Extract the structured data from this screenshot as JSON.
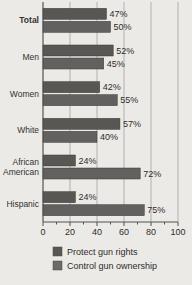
{
  "chart_data": {
    "type": "bar",
    "orientation": "horizontal",
    "title": "",
    "subtitle": "",
    "xlabel": "",
    "ylabel": "",
    "xlim": [
      0,
      100
    ],
    "xticks": [
      0,
      20,
      40,
      60,
      80,
      100
    ],
    "xticklabels": [
      "0",
      "20",
      "40",
      "60",
      "80",
      "100"
    ],
    "grid": true,
    "grid_axis": "x",
    "legend_position": "bottom",
    "value_label_suffix": "%",
    "categories": [
      "Total",
      "Men",
      "Women",
      "White",
      "African American",
      "Hispanic"
    ],
    "category_bold": [
      "Total"
    ],
    "series": [
      {
        "name": "Protect gun rights",
        "color": "#595754",
        "values": [
          47,
          52,
          42,
          57,
          24,
          24
        ],
        "labels": [
          "47%",
          "52%",
          "42%",
          "57%",
          "24%",
          "24%"
        ]
      },
      {
        "name": "Control gun ownership",
        "color": "#636160",
        "values": [
          50,
          45,
          55,
          40,
          72,
          75
        ],
        "labels": [
          "50%",
          "45%",
          "55%",
          "40%",
          "72%",
          "75%"
        ]
      }
    ]
  },
  "legend": {
    "items": [
      {
        "label": "Protect gun rights",
        "swatch_color": "#595754"
      },
      {
        "label": "Control gun ownership",
        "swatch_color": "#6d6b69"
      }
    ]
  },
  "colors": {
    "background": "#eceae7",
    "grid": "#9a9894",
    "axis": "#55534f",
    "text": "#2e2c2a"
  }
}
